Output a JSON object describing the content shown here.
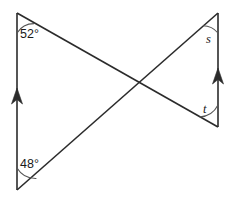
{
  "figure": {
    "background_color": "#ffffff",
    "stroke_color": "#2b2b2b",
    "stroke_width": 1.6,
    "labels": {
      "top_left_angle": "52°",
      "bottom_left_angle": "48°",
      "top_right_angle": "s",
      "bottom_right_angle": "t"
    },
    "points": {
      "top_left": {
        "x": 17,
        "y": 13
      },
      "bottom_left": {
        "x": 17,
        "y": 190
      },
      "top_right": {
        "x": 218,
        "y": 13
      },
      "bottom_right": {
        "x": 218,
        "y": 127
      },
      "intersection": {
        "x": 128,
        "y": 82
      }
    },
    "lines": [
      {
        "name": "left-vertical-line",
        "from": "top_left",
        "to": "bottom_left",
        "arrow": "up",
        "arrow_at": {
          "x": 17,
          "y": 96
        }
      },
      {
        "name": "right-vertical-line",
        "from": "top_right",
        "to": "bottom_right",
        "arrow": "up",
        "arrow_at": {
          "x": 218,
          "y": 76
        }
      },
      {
        "name": "transversal-top-left-to-bottom-right",
        "from": "top_left",
        "to": "bottom_right",
        "arrow": "none"
      },
      {
        "name": "transversal-bottom-left-to-top-right",
        "from": "bottom_left",
        "to": "top_right",
        "arrow": "none"
      }
    ],
    "angle_arcs": [
      {
        "name": "arc-52",
        "vertex": "top_left",
        "radius": 20
      },
      {
        "name": "arc-48",
        "vertex": "bottom_left",
        "radius": 22
      },
      {
        "name": "arc-s",
        "vertex": "top_right",
        "radius": 20
      },
      {
        "name": "arc-t",
        "vertex": "bottom_right",
        "radius": 22
      }
    ]
  }
}
